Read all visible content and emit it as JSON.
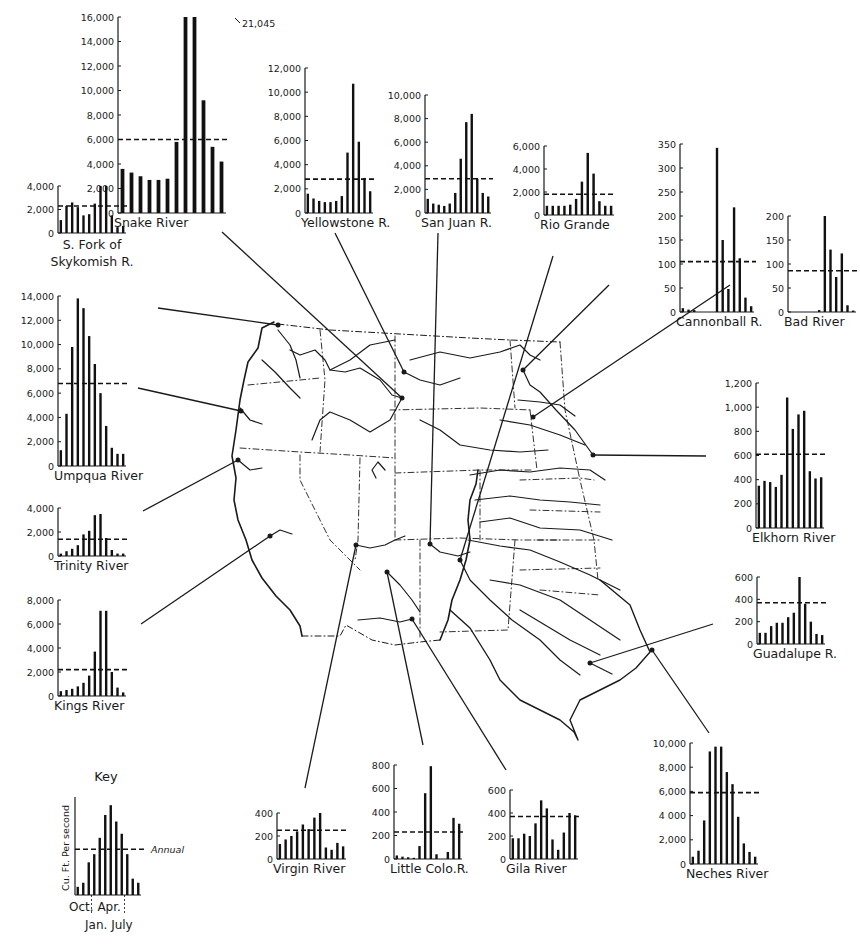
{
  "figure": {
    "key": {
      "title": "Key",
      "ylabel": "Cu. Ft. Per second",
      "annual_label": "Annual",
      "xlabels_top": [
        "Oct.",
        "Apr."
      ],
      "xlabels_bottom": [
        "Jan.",
        "July"
      ]
    }
  },
  "chart_data": [
    {
      "id": "snake",
      "type": "bar",
      "title": "Snake River",
      "ylabel": "Cu. Ft. Per second",
      "months": [
        "Oct",
        "Nov",
        "Dec",
        "Jan",
        "Feb",
        "Mar",
        "Apr",
        "May",
        "Jun",
        "Jul",
        "Aug",
        "Sep"
      ],
      "values": [
        3600,
        3300,
        3000,
        2700,
        2700,
        2800,
        5800,
        16000,
        21045,
        9200,
        5400,
        4200
      ],
      "annual": 6000,
      "ticks": [
        0,
        2000,
        4000,
        6000,
        8000,
        10000,
        12000,
        14000,
        16000
      ],
      "tick_labels": [
        "0",
        "2,000",
        "4,000",
        "6,000",
        "8,000",
        "10,000",
        "12,000",
        "14,000",
        "16,000"
      ],
      "ylim": [
        0,
        16000
      ],
      "annotation": "21,045",
      "box": {
        "x": 118,
        "y": 17,
        "w": 108,
        "h": 196
      }
    },
    {
      "id": "yellowstone",
      "type": "bar",
      "title": "Yellowstone R.",
      "months": [
        "Oct",
        "Nov",
        "Dec",
        "Jan",
        "Feb",
        "Mar",
        "Apr",
        "May",
        "Jun",
        "Jul",
        "Aug",
        "Sep"
      ],
      "values": [
        1600,
        1200,
        1000,
        900,
        900,
        1000,
        1400,
        5000,
        10700,
        5900,
        2900,
        1800
      ],
      "annual": 2800,
      "ticks": [
        0,
        2000,
        4000,
        6000,
        8000,
        10000,
        12000
      ],
      "tick_labels": [
        "0",
        "2,000",
        "4,000",
        "6,000",
        "8,000",
        "10,000",
        "12,000"
      ],
      "ylim": [
        0,
        12000
      ],
      "box": {
        "x": 305,
        "y": 68,
        "w": 68,
        "h": 145
      }
    },
    {
      "id": "sanjuan",
      "type": "bar",
      "title": "San Juan R.",
      "months": [
        "Oct",
        "Nov",
        "Dec",
        "Jan",
        "Feb",
        "Mar",
        "Apr",
        "May",
        "Jun",
        "Jul",
        "Aug",
        "Sep"
      ],
      "values": [
        1200,
        800,
        700,
        600,
        800,
        1700,
        4600,
        7700,
        8400,
        2900,
        1700,
        1400
      ],
      "annual": 2900,
      "ticks": [
        0,
        2000,
        4000,
        6000,
        8000,
        10000
      ],
      "tick_labels": [
        "0",
        "2,000",
        "4,000",
        "6,000",
        "8,000",
        "10,000"
      ],
      "ylim": [
        0,
        10000
      ],
      "box": {
        "x": 425,
        "y": 95,
        "w": 66,
        "h": 118
      }
    },
    {
      "id": "riogrande",
      "type": "bar",
      "title": "Rio Grande",
      "months": [
        "Oct",
        "Nov",
        "Dec",
        "Jan",
        "Feb",
        "Mar",
        "Apr",
        "May",
        "Jun",
        "Jul",
        "Aug",
        "Sep"
      ],
      "values": [
        800,
        800,
        800,
        800,
        900,
        1400,
        2900,
        5400,
        3600,
        1200,
        800,
        800
      ],
      "annual": 1800,
      "ticks": [
        0,
        2000,
        4000,
        6000
      ],
      "tick_labels": [
        "0",
        "2,000",
        "4,000",
        "6,000"
      ],
      "ylim": [
        0,
        6000
      ],
      "box": {
        "x": 544,
        "y": 146,
        "w": 70,
        "h": 69
      }
    },
    {
      "id": "cannonball",
      "type": "bar",
      "title": "Cannonball R.",
      "months": [
        "Oct",
        "Nov",
        "Dec",
        "Jan",
        "Feb",
        "Mar",
        "Apr",
        "May",
        "Jun",
        "Jul",
        "Aug",
        "Sep"
      ],
      "values": [
        8,
        5,
        4,
        0,
        0,
        0,
        342,
        150,
        48,
        218,
        112,
        30,
        12
      ],
      "annual": 105,
      "ticks": [
        0,
        50,
        100,
        150,
        200,
        250,
        300,
        350
      ],
      "tick_labels": [
        "0",
        "50",
        "100",
        "150",
        "200",
        "250",
        "300",
        "350"
      ],
      "ylim": [
        0,
        350
      ],
      "box": {
        "x": 680,
        "y": 144,
        "w": 74,
        "h": 168
      }
    },
    {
      "id": "bad",
      "type": "bar",
      "title": "Bad River",
      "months": [
        "Oct",
        "Nov",
        "Dec",
        "Jan",
        "Feb",
        "Mar",
        "Apr",
        "May",
        "Jun",
        "Jul",
        "Aug",
        "Sep"
      ],
      "values": [
        0,
        0,
        0,
        0,
        0,
        4,
        200,
        130,
        73,
        122,
        14,
        3
      ],
      "annual": 86,
      "ticks": [
        0,
        50,
        100,
        150,
        200
      ],
      "tick_labels": [
        "0",
        "50",
        "100",
        "150",
        "200"
      ],
      "ylim": [
        0,
        200
      ],
      "box": {
        "x": 788,
        "y": 216,
        "w": 68,
        "h": 96
      }
    },
    {
      "id": "skykomish",
      "type": "bar",
      "title": "S. Fork of Skykomish R.",
      "months": [
        "Oct",
        "Nov",
        "Dec",
        "Jan",
        "Feb",
        "Mar",
        "Apr",
        "May",
        "Jun",
        "Jul",
        "Aug",
        "Sep"
      ],
      "values": [
        1100,
        2300,
        2600,
        2200,
        1500,
        1600,
        2500,
        4000,
        4000,
        1500,
        500,
        600
      ],
      "annual": 2300,
      "ticks": [
        0,
        2000,
        4000
      ],
      "tick_labels": [
        "0",
        "2,000",
        "4,000"
      ],
      "ylim": [
        0,
        4000
      ],
      "box": {
        "x": 58,
        "y": 186,
        "w": 68,
        "h": 47
      }
    },
    {
      "id": "umpqua",
      "type": "bar",
      "title": "Umpqua River",
      "months": [
        "Oct",
        "Nov",
        "Dec",
        "Jan",
        "Feb",
        "Mar",
        "Apr",
        "May",
        "Jun",
        "Jul",
        "Aug",
        "Sep"
      ],
      "values": [
        1300,
        4300,
        9800,
        13800,
        13000,
        10700,
        8400,
        6000,
        3300,
        1500,
        1000,
        1000
      ],
      "annual": 6800,
      "ticks": [
        0,
        2000,
        4000,
        6000,
        8000,
        10000,
        12000,
        14000
      ],
      "tick_labels": [
        "0",
        "2,000",
        "4,000",
        "6,000",
        "8,000",
        "10,000",
        "12,000",
        "14,000"
      ],
      "ylim": [
        0,
        14000
      ],
      "box": {
        "x": 58,
        "y": 296,
        "w": 68,
        "h": 170
      }
    },
    {
      "id": "trinity",
      "type": "bar",
      "title": "Trinity River",
      "months": [
        "Oct",
        "Nov",
        "Dec",
        "Jan",
        "Feb",
        "Mar",
        "Apr",
        "May",
        "Jun",
        "Jul",
        "Aug",
        "Sep"
      ],
      "values": [
        200,
        400,
        600,
        900,
        1800,
        2100,
        3400,
        3500,
        1500,
        500,
        200,
        200
      ],
      "annual": 1400,
      "ticks": [
        0,
        2000,
        4000
      ],
      "tick_labels": [
        "0",
        "2,000",
        "4,000"
      ],
      "ylim": [
        0,
        4000
      ],
      "box": {
        "x": 58,
        "y": 508,
        "w": 68,
        "h": 48
      }
    },
    {
      "id": "kings",
      "type": "bar",
      "title": "Kings River",
      "months": [
        "Oct",
        "Nov",
        "Dec",
        "Jan",
        "Feb",
        "Mar",
        "Apr",
        "May",
        "Jun",
        "Jul",
        "Aug",
        "Sep"
      ],
      "values": [
        400,
        500,
        600,
        800,
        1100,
        1700,
        3700,
        7100,
        7100,
        2000,
        700,
        300
      ],
      "annual": 2200,
      "ticks": [
        0,
        2000,
        4000,
        6000,
        8000
      ],
      "tick_labels": [
        "0",
        "2,000",
        "4,000",
        "6,000",
        "8,000"
      ],
      "ylim": [
        0,
        8000
      ],
      "box": {
        "x": 58,
        "y": 600,
        "w": 68,
        "h": 96
      }
    },
    {
      "id": "elkhorn",
      "type": "bar",
      "title": "Elkhorn River",
      "months": [
        "Oct",
        "Nov",
        "Dec",
        "Jan",
        "Feb",
        "Mar",
        "Apr",
        "May",
        "Jun",
        "Jul",
        "Aug",
        "Sep"
      ],
      "values": [
        350,
        390,
        380,
        340,
        440,
        1080,
        820,
        940,
        970,
        470,
        410,
        420
      ],
      "annual": 610,
      "ticks": [
        0,
        200,
        400,
        600,
        800,
        1000,
        1200
      ],
      "tick_labels": [
        "0",
        "200",
        "400",
        "600",
        "800",
        "1,000",
        "1,200"
      ],
      "ylim": [
        0,
        1200
      ],
      "box": {
        "x": 756,
        "y": 383,
        "w": 68,
        "h": 145
      }
    },
    {
      "id": "guadalupe",
      "type": "bar",
      "title": "Guadalupe R.",
      "months": [
        "Oct",
        "Nov",
        "Dec",
        "Jan",
        "Feb",
        "Mar",
        "Apr",
        "May",
        "Jun",
        "Jul",
        "Aug",
        "Sep"
      ],
      "values": [
        100,
        100,
        160,
        190,
        190,
        240,
        280,
        620,
        360,
        200,
        90,
        80
      ],
      "annual": 370,
      "ticks": [
        0,
        200,
        400,
        600
      ],
      "tick_labels": [
        "0",
        "200",
        "400",
        "600"
      ],
      "ylim": [
        0,
        600
      ],
      "box": {
        "x": 757,
        "y": 577,
        "w": 68,
        "h": 67
      }
    },
    {
      "id": "neches",
      "type": "bar",
      "title": "Neches River",
      "months": [
        "Oct",
        "Nov",
        "Dec",
        "Jan",
        "Feb",
        "Mar",
        "Apr",
        "May",
        "Jun",
        "Jul",
        "Aug",
        "Sep"
      ],
      "values": [
        600,
        1100,
        3600,
        9300,
        9700,
        9700,
        7600,
        6600,
        3900,
        1700,
        1000,
        600
      ],
      "annual": 5900,
      "ticks": [
        0,
        2000,
        4000,
        6000,
        8000,
        10000
      ],
      "tick_labels": [
        "0",
        "2,000",
        "4 000",
        "6,000",
        "8,000",
        "10,000"
      ],
      "ylim": [
        0,
        10000
      ],
      "box": {
        "x": 690,
        "y": 743,
        "w": 68,
        "h": 121
      }
    },
    {
      "id": "virgin",
      "type": "bar",
      "title": "Virgin River",
      "months": [
        "Oct",
        "Nov",
        "Dec",
        "Jan",
        "Feb",
        "Mar",
        "Apr",
        "May",
        "Jun",
        "Jul",
        "Aug",
        "Sep"
      ],
      "values": [
        130,
        170,
        200,
        240,
        300,
        260,
        360,
        410,
        100,
        80,
        140,
        110
      ],
      "annual": 250,
      "ticks": [
        0,
        200,
        400
      ],
      "tick_labels": [
        "0",
        "200",
        "400"
      ],
      "ylim": [
        0,
        400
      ],
      "box": {
        "x": 277,
        "y": 813,
        "w": 69,
        "h": 46
      }
    },
    {
      "id": "littlecolo",
      "type": "bar",
      "title": "Little Colo.R.",
      "months": [
        "Oct",
        "Nov",
        "Dec",
        "Jan",
        "Feb",
        "Mar",
        "Apr",
        "May",
        "Jun",
        "Jul",
        "Aug",
        "Sep"
      ],
      "values": [
        30,
        20,
        15,
        10,
        110,
        560,
        790,
        40,
        0,
        60,
        350,
        300
      ],
      "annual": 230,
      "ticks": [
        0,
        200,
        400,
        600,
        800
      ],
      "tick_labels": [
        "0",
        "200",
        "400",
        "600",
        "800"
      ],
      "ylim": [
        0,
        800
      ],
      "box": {
        "x": 394,
        "y": 765,
        "w": 68,
        "h": 94
      }
    },
    {
      "id": "gila",
      "type": "bar",
      "title": "Gila River",
      "months": [
        "Oct",
        "Nov",
        "Dec",
        "Jan",
        "Feb",
        "Mar",
        "Apr",
        "May",
        "Jun",
        "Jul",
        "Aug",
        "Sep"
      ],
      "values": [
        180,
        180,
        220,
        200,
        310,
        510,
        440,
        170,
        80,
        230,
        400,
        380
      ],
      "annual": 370,
      "ticks": [
        0,
        200,
        400,
        600
      ],
      "tick_labels": [
        "0",
        "200",
        "400",
        "600"
      ],
      "ylim": [
        0,
        600
      ],
      "box": {
        "x": 510,
        "y": 790,
        "w": 68,
        "h": 69
      }
    },
    {
      "id": "key",
      "type": "bar",
      "title": "Key",
      "ylabel": "Cu. Ft. Per second",
      "months": [
        "Oct",
        "Nov",
        "Dec",
        "Jan",
        "Feb",
        "Mar",
        "Apr",
        "May",
        "Jun",
        "Jul",
        "Aug",
        "Sep"
      ],
      "values": [
        1,
        1.5,
        4,
        5,
        7,
        9.8,
        11,
        9,
        7.5,
        5,
        2,
        1.5
      ],
      "annual": 5.6,
      "ticks": [],
      "tick_labels": [],
      "ylim": [
        0,
        12
      ],
      "annotation": "Annual",
      "box": {
        "x": 75,
        "y": 797,
        "w": 66,
        "h": 98
      }
    }
  ],
  "leaders": [
    {
      "from": [
        222,
        232
      ],
      "to": [
        402,
        398
      ],
      "river": "snake"
    },
    {
      "from": [
        335,
        233
      ],
      "to": [
        404,
        372
      ],
      "river": "yellowstone"
    },
    {
      "from": [
        438,
        233
      ],
      "to": [
        430,
        544
      ],
      "river": "sanjuan"
    },
    {
      "from": [
        553,
        256
      ],
      "to": [
        460,
        560
      ],
      "river": "riogrande"
    },
    {
      "from": [
        609,
        285
      ],
      "to": [
        523,
        370
      ],
      "river": "cannonball"
    },
    {
      "from": [
        730,
        285
      ],
      "to": [
        533,
        417
      ],
      "river": "bad"
    },
    {
      "from": [
        158,
        308
      ],
      "to": [
        278,
        325
      ],
      "river": "skykomish"
    },
    {
      "from": [
        138,
        388
      ],
      "to": [
        241,
        411
      ],
      "river": "umpqua"
    },
    {
      "from": [
        143,
        511
      ],
      "to": [
        238,
        460
      ],
      "river": "trinity"
    },
    {
      "from": [
        141,
        624
      ],
      "to": [
        270,
        536
      ],
      "river": "kings"
    },
    {
      "from": [
        706,
        456
      ],
      "to": [
        593,
        455
      ],
      "river": "elkhorn"
    },
    {
      "from": [
        713,
        624
      ],
      "to": [
        590,
        663
      ],
      "river": "guadalupe"
    },
    {
      "from": [
        709,
        733
      ],
      "to": [
        652,
        650
      ],
      "river": "neches"
    },
    {
      "from": [
        305,
        788
      ],
      "to": [
        356,
        545
      ],
      "river": "virgin"
    },
    {
      "from": [
        423,
        745
      ],
      "to": [
        387,
        572
      ],
      "river": "littlecolo"
    },
    {
      "from": [
        506,
        770
      ],
      "to": [
        412,
        619
      ],
      "river": "gila"
    }
  ]
}
